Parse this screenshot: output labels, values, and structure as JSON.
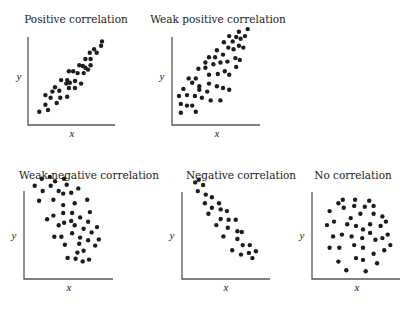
{
  "chart_data": [
    {
      "type": "scatter",
      "title": "Positive correlation",
      "xlabel": "x",
      "ylabel": "y",
      "xlim": [
        0,
        10
      ],
      "ylim": [
        0,
        10
      ],
      "grid": false,
      "points": [
        [
          1.3,
          1.5
        ],
        [
          2.0,
          2.3
        ],
        [
          2.3,
          1.7
        ],
        [
          2.0,
          3.4
        ],
        [
          2.6,
          3.1
        ],
        [
          2.8,
          3.8
        ],
        [
          3.3,
          2.5
        ],
        [
          3.7,
          3.1
        ],
        [
          3.6,
          3.9
        ],
        [
          3.1,
          4.3
        ],
        [
          3.8,
          5.1
        ],
        [
          4.5,
          3.2
        ],
        [
          4.4,
          4.7
        ],
        [
          4.7,
          4.2
        ],
        [
          4.8,
          4.8
        ],
        [
          5.4,
          4.2
        ],
        [
          4.7,
          6.1
        ],
        [
          5.2,
          6.1
        ],
        [
          4.5,
          5.1
        ],
        [
          5.4,
          5.0
        ],
        [
          6.1,
          4.7
        ],
        [
          5.7,
          5.9
        ],
        [
          5.9,
          6.8
        ],
        [
          6.3,
          6.7
        ],
        [
          6.4,
          5.9
        ],
        [
          6.6,
          6.5
        ],
        [
          6.9,
          6.3
        ],
        [
          6.6,
          7.5
        ],
        [
          7.2,
          6.8
        ],
        [
          7.1,
          8.2
        ],
        [
          7.2,
          7.5
        ],
        [
          7.6,
          8.6
        ],
        [
          7.9,
          8.2
        ],
        [
          8.4,
          9.0
        ],
        [
          8.5,
          9.5
        ]
      ]
    },
    {
      "type": "scatter",
      "title": "Weak positive correlation",
      "xlabel": "x",
      "ylabel": "y",
      "xlim": [
        0,
        10
      ],
      "ylim": [
        0,
        10
      ],
      "grid": false,
      "points": [
        [
          1.0,
          1.4
        ],
        [
          1.0,
          2.4
        ],
        [
          1.7,
          2.2
        ],
        [
          2.3,
          2.2
        ],
        [
          2.7,
          1.5
        ],
        [
          0.8,
          3.3
        ],
        [
          1.3,
          4.1
        ],
        [
          1.7,
          3.4
        ],
        [
          2.6,
          3.3
        ],
        [
          3.1,
          4.0
        ],
        [
          3.4,
          3.1
        ],
        [
          4.0,
          3.8
        ],
        [
          4.4,
          2.8
        ],
        [
          5.5,
          2.8
        ],
        [
          5.8,
          4.2
        ],
        [
          6.5,
          4.0
        ],
        [
          1.9,
          5.3
        ],
        [
          2.3,
          4.8
        ],
        [
          2.7,
          5.3
        ],
        [
          3.1,
          4.4
        ],
        [
          4.2,
          4.7
        ],
        [
          5.1,
          4.4
        ],
        [
          4.2,
          5.7
        ],
        [
          5.2,
          5.8
        ],
        [
          6.5,
          5.7
        ],
        [
          3.0,
          6.4
        ],
        [
          3.8,
          6.5
        ],
        [
          3.8,
          7.1
        ],
        [
          4.7,
          6.9
        ],
        [
          5.5,
          7.1
        ],
        [
          6.3,
          7.2
        ],
        [
          6.0,
          6.1
        ],
        [
          7.3,
          6.6
        ],
        [
          4.2,
          7.7
        ],
        [
          4.9,
          7.7
        ],
        [
          5.8,
          8.0
        ],
        [
          5.1,
          8.5
        ],
        [
          7.2,
          7.6
        ],
        [
          7.7,
          7.4
        ],
        [
          6.4,
          8.8
        ],
        [
          7.0,
          8.6
        ],
        [
          7.6,
          9.0
        ],
        [
          8.1,
          8.8
        ],
        [
          5.9,
          9.4
        ],
        [
          6.9,
          9.5
        ],
        [
          6.5,
          10.1
        ],
        [
          7.3,
          10.0
        ],
        [
          7.8,
          9.8
        ],
        [
          7.6,
          10.6
        ],
        [
          8.3,
          10.1
        ],
        [
          8.6,
          10.9
        ]
      ]
    },
    {
      "type": "scatter",
      "title": "Weak negative correlation",
      "xlabel": "x",
      "ylabel": "y",
      "xlim": [
        0,
        10
      ],
      "ylim": [
        0,
        10
      ],
      "grid": false,
      "points": [
        [
          2.0,
          11.4
        ],
        [
          2.9,
          11.6
        ],
        [
          3.5,
          11.1
        ],
        [
          4.5,
          11.4
        ],
        [
          1.2,
          10.6
        ],
        [
          2.1,
          10.0
        ],
        [
          3.0,
          10.6
        ],
        [
          3.9,
          10.0
        ],
        [
          4.4,
          9.7
        ],
        [
          4.8,
          10.7
        ],
        [
          5.3,
          9.8
        ],
        [
          6.1,
          10.3
        ],
        [
          1.7,
          8.9
        ],
        [
          3.3,
          9.0
        ],
        [
          4.4,
          8.4
        ],
        [
          5.7,
          8.6
        ],
        [
          7.1,
          9.0
        ],
        [
          2.6,
          6.8
        ],
        [
          3.3,
          7.2
        ],
        [
          4.4,
          7.5
        ],
        [
          5.4,
          7.5
        ],
        [
          7.4,
          7.6
        ],
        [
          3.9,
          6.1
        ],
        [
          4.5,
          6.4
        ],
        [
          5.3,
          6.6
        ],
        [
          5.7,
          6.1
        ],
        [
          6.3,
          7.0
        ],
        [
          7.2,
          6.5
        ],
        [
          6.7,
          5.7
        ],
        [
          7.6,
          5.3
        ],
        [
          8.2,
          5.9
        ],
        [
          3.4,
          4.8
        ],
        [
          4.2,
          4.8
        ],
        [
          5.4,
          5.2
        ],
        [
          6.3,
          4.7
        ],
        [
          7.2,
          4.4
        ],
        [
          8.4,
          4.5
        ],
        [
          4.6,
          3.9
        ],
        [
          6.2,
          4.0
        ],
        [
          8.0,
          3.8
        ],
        [
          6.0,
          3.0
        ],
        [
          6.7,
          3.2
        ],
        [
          4.9,
          2.4
        ],
        [
          5.8,
          2.3
        ],
        [
          6.6,
          2.0
        ],
        [
          7.3,
          2.2
        ]
      ]
    },
    {
      "type": "scatter",
      "title": "Negative correlation",
      "xlabel": "x",
      "ylabel": "y",
      "xlim": [
        0,
        10
      ],
      "ylim": [
        0,
        10
      ],
      "grid": false,
      "points": [
        [
          1.5,
          11.1
        ],
        [
          1.9,
          11.4
        ],
        [
          2.4,
          10.8
        ],
        [
          1.8,
          10.1
        ],
        [
          2.7,
          9.7
        ],
        [
          3.4,
          9.4
        ],
        [
          2.6,
          8.7
        ],
        [
          3.4,
          8.2
        ],
        [
          4.2,
          8.7
        ],
        [
          3.0,
          7.5
        ],
        [
          4.4,
          8.0
        ],
        [
          5.1,
          7.8
        ],
        [
          3.9,
          6.2
        ],
        [
          4.4,
          6.9
        ],
        [
          5.3,
          6.8
        ],
        [
          6.1,
          6.8
        ],
        [
          5.2,
          5.9
        ],
        [
          6.3,
          5.5
        ],
        [
          6.8,
          5.4
        ],
        [
          4.7,
          4.9
        ],
        [
          6.3,
          4.6
        ],
        [
          6.9,
          3.9
        ],
        [
          7.7,
          3.9
        ],
        [
          5.7,
          3.3
        ],
        [
          6.7,
          2.8
        ],
        [
          7.6,
          3.0
        ],
        [
          8.4,
          3.2
        ],
        [
          8.0,
          2.4
        ]
      ]
    },
    {
      "type": "scatter",
      "title": "No correlation",
      "xlabel": "x",
      "ylabel": "y",
      "xlim": [
        0,
        10
      ],
      "ylim": [
        0,
        10
      ],
      "grid": false,
      "points": [
        [
          3.0,
          8.7
        ],
        [
          3.5,
          9.1
        ],
        [
          4.9,
          9.1
        ],
        [
          3.6,
          8.2
        ],
        [
          4.8,
          8.4
        ],
        [
          6.5,
          9.0
        ],
        [
          6.0,
          8.3
        ],
        [
          7.0,
          8.4
        ],
        [
          2.0,
          7.8
        ],
        [
          5.5,
          7.5
        ],
        [
          4.4,
          7.0
        ],
        [
          7.0,
          7.5
        ],
        [
          8.0,
          7.2
        ],
        [
          1.7,
          6.2
        ],
        [
          2.5,
          6.6
        ],
        [
          4.0,
          6.3
        ],
        [
          5.0,
          6.1
        ],
        [
          5.8,
          5.7
        ],
        [
          6.6,
          6.3
        ],
        [
          7.8,
          6.1
        ],
        [
          8.4,
          6.6
        ],
        [
          2.4,
          4.9
        ],
        [
          3.4,
          5.1
        ],
        [
          4.5,
          4.9
        ],
        [
          5.7,
          4.7
        ],
        [
          6.6,
          5.3
        ],
        [
          7.2,
          4.5
        ],
        [
          8.0,
          4.7
        ],
        [
          8.6,
          5.1
        ],
        [
          2.0,
          3.6
        ],
        [
          3.1,
          3.6
        ],
        [
          4.8,
          3.9
        ],
        [
          5.8,
          3.6
        ],
        [
          8.9,
          3.9
        ],
        [
          7.0,
          2.9
        ],
        [
          8.2,
          3.3
        ],
        [
          3.0,
          2.0
        ],
        [
          5.0,
          2.4
        ],
        [
          5.8,
          2.2
        ],
        [
          7.4,
          1.8
        ],
        [
          3.9,
          1.0
        ],
        [
          6.1,
          0.9
        ]
      ]
    }
  ]
}
